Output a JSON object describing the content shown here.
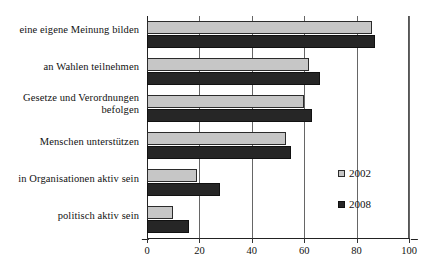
{
  "chart_data": {
    "type": "bar",
    "orientation": "horizontal",
    "title": "",
    "xlabel": "",
    "ylabel": "",
    "xlim": [
      0,
      100
    ],
    "xticks": [
      0,
      20,
      40,
      60,
      80,
      100
    ],
    "xtick_labels": [
      "0",
      "20",
      "40",
      "60",
      "80",
      "100"
    ],
    "grid": true,
    "grid_axis": "x",
    "legend_position": "center-right",
    "categories": [
      "eine eigene Meinung bilden",
      "an Wahlen teilnehmen",
      "Gesetze und Verordnungen befolgen",
      "Menschen unterstützen",
      "in Organisationen aktiv sein",
      "politisch aktiv sein"
    ],
    "category_lines": [
      [
        "eine eigene Meinung bilden"
      ],
      [
        "an Wahlen teilnehmen"
      ],
      [
        "Gesetze und Verordnungen",
        "befolgen"
      ],
      [
        "Menschen unterstützen"
      ],
      [
        "in Organisationen aktiv sein"
      ],
      [
        "politisch aktiv sein"
      ]
    ],
    "series": [
      {
        "name": "2002",
        "color": "#c6c6c6",
        "values": [
          86,
          62,
          60,
          53,
          19,
          10
        ]
      },
      {
        "name": "2008",
        "color": "#262626",
        "values": [
          87,
          66,
          63,
          55,
          28,
          16
        ]
      }
    ]
  },
  "legend": {
    "items": [
      {
        "label": "2002"
      },
      {
        "label": "2008"
      }
    ]
  },
  "axis": {
    "x_tick_labels": [
      "0",
      "20",
      "40",
      "60",
      "80",
      "100"
    ]
  }
}
